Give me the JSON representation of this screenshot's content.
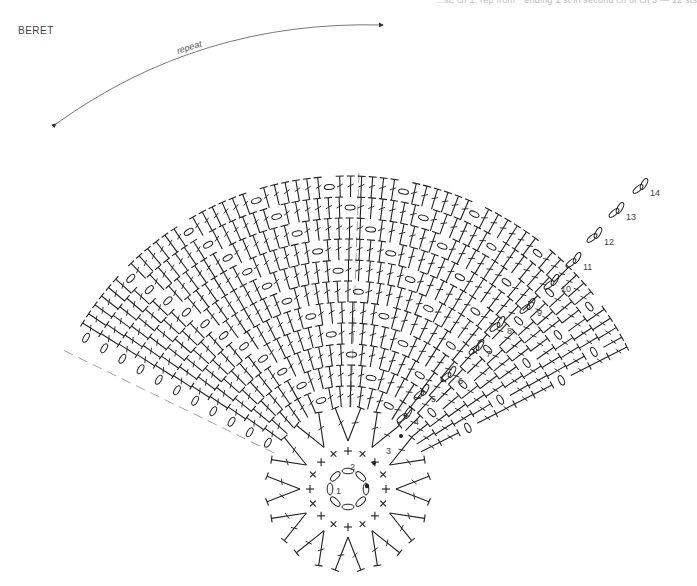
{
  "header": {
    "cut_off_text": "...st, ch 1, rep from * ending 1 st in second ch of ch 3 — 12 sts"
  },
  "title": "BERET",
  "repeat_label": "repeat",
  "chart": {
    "center": {
      "x": 348,
      "y": 489
    },
    "ring_radius": 18,
    "ring_chains": 8,
    "row2_sc": 16,
    "row3_dc_groups": 12,
    "row_labels": [
      {
        "n": "1",
        "x": 336,
        "y": 494
      },
      {
        "n": "2",
        "x": 350,
        "y": 470
      },
      {
        "n": "3",
        "x": 386,
        "y": 454
      },
      {
        "n": "4",
        "x": 414,
        "y": 425
      },
      {
        "n": "5",
        "x": 431,
        "y": 402
      },
      {
        "n": "6",
        "x": 458,
        "y": 384
      },
      {
        "n": "7",
        "x": 486,
        "y": 357
      },
      {
        "n": "8",
        "x": 507,
        "y": 334
      },
      {
        "n": "9",
        "x": 537,
        "y": 316
      },
      {
        "n": "10",
        "x": 561,
        "y": 292
      },
      {
        "n": "11",
        "x": 583,
        "y": 270
      },
      {
        "n": "12",
        "x": 604,
        "y": 245
      },
      {
        "n": "13",
        "x": 626,
        "y": 220
      },
      {
        "n": "14",
        "x": 650,
        "y": 196
      }
    ],
    "fan": {
      "start_deg": -150,
      "end_deg": -27,
      "inner_r": 60,
      "row_spacing": 21,
      "rows": 11,
      "repeat_split_deg": -88
    }
  },
  "colors": {
    "ink": "#222222",
    "dash": "#9a9a9a",
    "label": "#444444"
  }
}
